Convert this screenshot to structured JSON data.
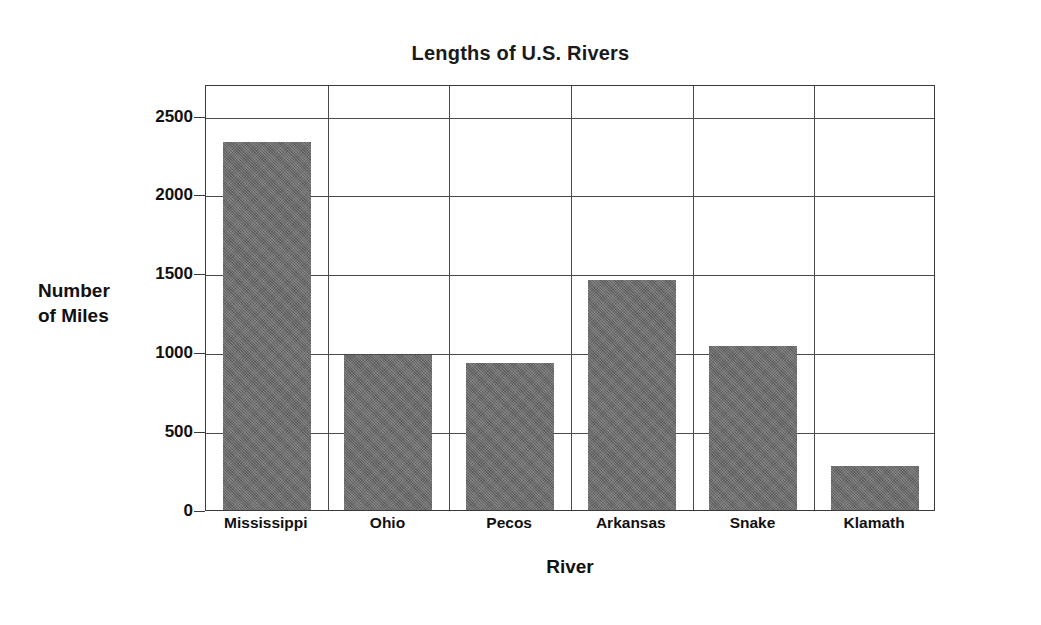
{
  "chart_data": {
    "type": "bar",
    "title": "Lengths of U.S. Rivers",
    "xlabel": "River",
    "ylabel": "Number\nof Miles",
    "categories": [
      "Mississippi",
      "Ohio",
      "Pecos",
      "Arkansas",
      "Snake",
      "Klamath"
    ],
    "values": [
      2330,
      980,
      930,
      1460,
      1040,
      280
    ],
    "ylim": [
      0,
      2700
    ],
    "yticks": [
      0,
      500,
      1000,
      1500,
      2000,
      2500
    ],
    "ytick_labels": [
      "0",
      "500",
      "1000",
      "1500",
      "2000",
      "2500"
    ],
    "grid": "horizontal gridlines at each y tick; vertical gridlines separating each category column",
    "legend": "none",
    "bar_color": "#6b6b6b",
    "axis_color": "#3a3a3a",
    "background_color": "#ffffff"
  },
  "axes": {
    "y_unit_label_line1": "Number",
    "y_unit_label_line2": "of Miles"
  }
}
